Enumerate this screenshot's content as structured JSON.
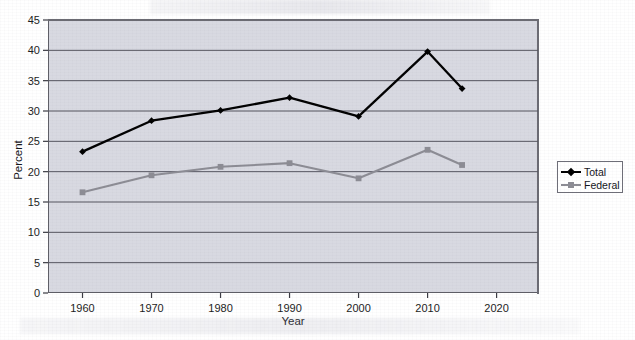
{
  "chart_data": {
    "type": "line",
    "title": "",
    "xlabel": "Year",
    "ylabel": "Percent",
    "x": [
      1960,
      1970,
      1980,
      1990,
      2000,
      2010,
      2015
    ],
    "xlim": [
      1955,
      2026
    ],
    "ylim": [
      0,
      45
    ],
    "xticks": [
      "1960",
      "1970",
      "1980",
      "1990",
      "2000",
      "2010",
      "2020"
    ],
    "xtick_values": [
      1960,
      1970,
      1980,
      1990,
      2000,
      2010,
      2020
    ],
    "yticks": [
      "0",
      "5",
      "10",
      "15",
      "20",
      "25",
      "30",
      "35",
      "40",
      "45"
    ],
    "ytick_values": [
      0,
      5,
      10,
      15,
      20,
      25,
      30,
      35,
      40,
      45
    ],
    "grid": "horizontal",
    "legend_position": "right",
    "series": [
      {
        "name": "Total",
        "color": "#000000",
        "marker": "diamond",
        "values": [
          23.3,
          28.4,
          30.1,
          32.2,
          29.1,
          39.8,
          33.7
        ]
      },
      {
        "name": "Federal",
        "color": "#8c8c94",
        "marker": "square",
        "values": [
          16.6,
          19.4,
          20.8,
          21.4,
          18.9,
          23.6,
          21.1
        ]
      }
    ]
  },
  "legend": {
    "items": [
      {
        "label": "Total"
      },
      {
        "label": "Federal"
      }
    ]
  },
  "axes": {
    "y_title": "Percent",
    "x_title": "Year"
  }
}
